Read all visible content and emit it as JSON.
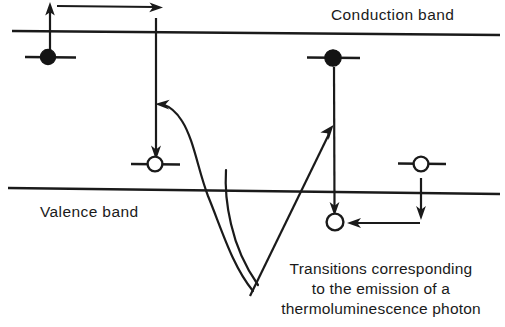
{
  "figure": {
    "background_color": "#ffffff",
    "ink_color": "#1a1a1a"
  },
  "labels": {
    "conduction_band": "Conduction band",
    "valence_band": "Valence band"
  },
  "caption": {
    "line1": "Transitions corresponding",
    "line2": "to the emission of a",
    "line3": "thermoluminescence photon"
  },
  "bands": [
    {
      "name": "conduction-band",
      "label": "Conduction band",
      "x1": 12,
      "y1": 31,
      "x2": 500,
      "y2": 35
    },
    {
      "name": "valence-band",
      "label": "Valence band",
      "x1": 8,
      "y1": 188,
      "x2": 500,
      "y2": 194
    }
  ],
  "carriers": [
    {
      "name": "trapped-electron-left",
      "type": "electron",
      "fill": "filled",
      "cx": 48,
      "cy": 57,
      "r": 7.5,
      "level_x1": 25,
      "level_x2": 76
    },
    {
      "name": "trapped-electron-right",
      "type": "electron",
      "fill": "filled",
      "cx": 333,
      "cy": 58,
      "r": 8,
      "level_x1": 307,
      "level_x2": 360
    },
    {
      "name": "hole-center",
      "type": "hole",
      "fill": "open",
      "cx": 155,
      "cy": 164,
      "r": 7.5,
      "level_x1": 131,
      "level_x2": 180
    },
    {
      "name": "hole-right",
      "type": "hole",
      "fill": "open",
      "cx": 421,
      "cy": 164,
      "r": 7.5,
      "level_x1": 398,
      "level_x2": 446
    },
    {
      "name": "hole-recombination-site",
      "type": "hole",
      "fill": "open",
      "cx": 335,
      "cy": 222,
      "r": 8.5,
      "level_x1": null,
      "level_x2": null
    }
  ],
  "transitions": [
    {
      "name": "electron-release-up-arrow",
      "direction": "up",
      "x": 50,
      "y_from": 50,
      "y_to": 4
    },
    {
      "name": "conduction-drift-arrow",
      "direction": "right",
      "y": 6,
      "x_from": 57,
      "x_to": 161
    },
    {
      "name": "electron-capture-down-arrow",
      "direction": "down",
      "x": 156,
      "y_from": 18,
      "y_to": 156
    },
    {
      "name": "hole-release-down-arrow",
      "direction": "down",
      "x": 421,
      "y_from": 180,
      "y_to": 219
    },
    {
      "name": "hole-drift-left-arrow",
      "direction": "left",
      "y": 223,
      "x_from": 420,
      "x_to": 349
    },
    {
      "name": "electron-recombination-down-arrow",
      "direction": "down",
      "x": 334,
      "y_from": 68,
      "y_to": 212
    },
    {
      "name": "photon-emission-diagonal-arrow",
      "direction": "up-right",
      "x_from": 252,
      "y_from": 292,
      "x_to": 333,
      "y_to": 127
    }
  ],
  "pointer_curves": [
    {
      "name": "caption-pointer-to-capture",
      "target": "electron-capture-down-arrow"
    },
    {
      "name": "caption-pointer-to-recombination",
      "target": "photon-emission-diagonal-arrow"
    }
  ]
}
